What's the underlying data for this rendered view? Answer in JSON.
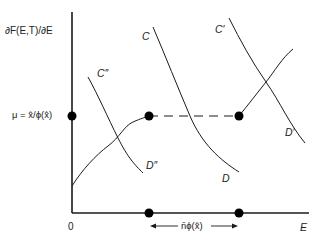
{
  "axes": {
    "y_label": "∂F(E,T)/∂E",
    "x_label": "E",
    "origin_label": "0",
    "mu_label": "μ  =  x̂/ϕ(x̂)"
  },
  "range": {
    "label": "n̄ϕ(x̂)"
  },
  "curves": {
    "c_double_prime": {
      "top": "C″",
      "bottom": "D″"
    },
    "c_main": {
      "top": "C",
      "bottom": "D"
    },
    "c_prime": {
      "top": "C′",
      "bottom": "D′"
    }
  },
  "colors": {
    "line": "#1a1a1a",
    "background": "#ffffff"
  }
}
